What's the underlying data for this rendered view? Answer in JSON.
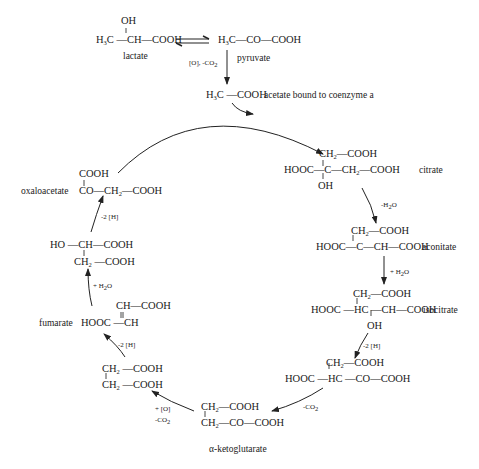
{
  "diagram": {
    "type": "metabolic-cycle",
    "top_chain": {
      "lactate": {
        "label": "lactate",
        "formula_top": "OH",
        "formula_main": "H3C—CH—COOH"
      },
      "equilibrium_symbol": "⇌",
      "pyruvate": {
        "label": "pyruvate",
        "formula_main": "H3C—CO—COOH"
      },
      "pyruvate_to_acetate_condition": "[O], -CO2",
      "acetate": {
        "label": "acetate bound to coenzyme a",
        "formula_main": "H3C—COOH"
      }
    },
    "cycle": [
      {
        "name": "citrate",
        "label": "citrate",
        "lines": [
          "CH2—COOH",
          "HOOC—C—CH2—COOH",
          "OH"
        ]
      },
      {
        "name": "aconitate",
        "label": "aconitate",
        "condition_in": "-H2O",
        "lines": [
          "CH2—COOH",
          "HOOC—C—CH—COOH"
        ]
      },
      {
        "name": "isocitrate",
        "label": "isocitrate",
        "condition_in": "+ H2O",
        "lines": [
          "CH2—COOH",
          "HOOC—HC—CH—COOH",
          "OH"
        ]
      },
      {
        "name": "oxalosuccinate",
        "label": "",
        "condition_in": "-2 [H]",
        "lines": [
          "CH2—COOH",
          "HOOC—HC—CO—COOH"
        ]
      },
      {
        "name": "alpha-ketoglutarate",
        "label": "α-ketoglutarate",
        "condition_in": "-CO2",
        "lines": [
          "CH2—COOH",
          "CH2—CO—COOH"
        ]
      },
      {
        "name": "succinate",
        "label": "",
        "condition_in": "+ [O] / -CO2",
        "lines": [
          "CH2—COOH",
          "CH2—COOH"
        ]
      },
      {
        "name": "fumarate",
        "label": "fumarate",
        "condition_in": "-2 [H]",
        "lines": [
          "CH—COOH",
          "HOOC—CH"
        ]
      },
      {
        "name": "malate",
        "label": "",
        "condition_in": "+ H2O",
        "lines": [
          "HO—CH—COOH",
          "CH2—COOH"
        ]
      },
      {
        "name": "oxaloacetate",
        "label": "oxaloacetate",
        "condition_in": "-2 [H]",
        "lines": [
          "COOH",
          "CO—CH2—COOH"
        ]
      }
    ],
    "conditions": {
      "pyruvate_acetate": "[O], -CO",
      "citrate_aconitate": "-H",
      "aconitate_isocitrate": "+ H",
      "isocitrate_oxalosuccinate": "-2 [H]",
      "oxalosuccinate_akg": "-CO",
      "akg_succinate_1": "+ [O]",
      "akg_succinate_2": "-CO",
      "succinate_fumarate": "-2 [H]",
      "fumarate_malate": "+ H",
      "malate_oxaloacetate": "-2 [H]"
    },
    "line_color": "#333333",
    "text_color": "#1a1a1a"
  }
}
